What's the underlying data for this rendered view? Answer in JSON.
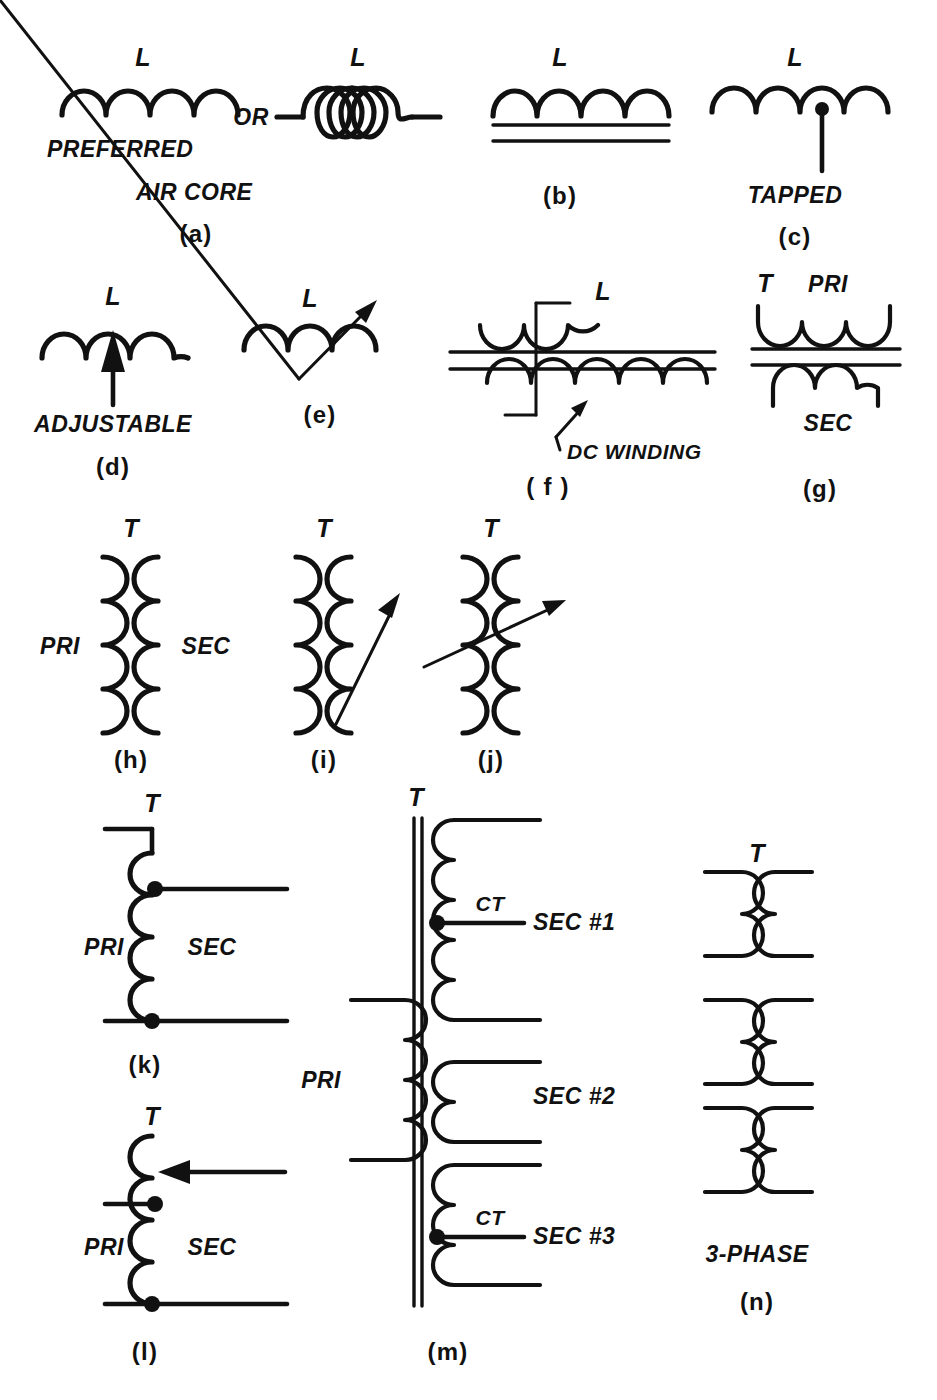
{
  "figure": {
    "background_color": "#ffffff",
    "ink_color": "#111111"
  },
  "panels": [
    {
      "id": "a",
      "caption": "(a)",
      "symbols": [
        "L",
        "L"
      ],
      "connector": "OR",
      "notes": [
        "PREFERRED",
        "AIR CORE"
      ],
      "description": "air-core inductor, arc style and spiral style"
    },
    {
      "id": "b",
      "caption": "(b)",
      "symbols": [
        "L"
      ],
      "notes": [],
      "description": "iron-core inductor with two core lines"
    },
    {
      "id": "c",
      "caption": "(c)",
      "symbols": [
        "L"
      ],
      "notes": [
        "TAPPED"
      ],
      "description": "tapped inductor"
    },
    {
      "id": "d",
      "caption": "(d)",
      "symbols": [
        "L"
      ],
      "notes": [
        "ADJUSTABLE"
      ],
      "description": "adjustable inductor, vertical arrow"
    },
    {
      "id": "e",
      "caption": "(e)",
      "symbols": [
        "L"
      ],
      "notes": [],
      "description": "variable inductor, diagonal arrow"
    },
    {
      "id": "f",
      "caption": "( f )",
      "symbols": [
        "L"
      ],
      "notes": [
        "DC WINDING"
      ],
      "description": "saturable reactor with DC control winding"
    },
    {
      "id": "g",
      "caption": "(g)",
      "symbols": [
        "T"
      ],
      "notes": [
        "PRI",
        "SEC"
      ],
      "description": "iron-core transformer, horizontal"
    },
    {
      "id": "h",
      "caption": "(h)",
      "symbols": [
        "T"
      ],
      "notes": [
        "PRI",
        "SEC"
      ],
      "description": "air-core transformer, vertical windings"
    },
    {
      "id": "i",
      "caption": "(i)",
      "symbols": [
        "T"
      ],
      "notes": [],
      "description": "variable coupling transformer, arrow on secondary"
    },
    {
      "id": "j",
      "caption": "(j)",
      "symbols": [
        "T"
      ],
      "notes": [],
      "description": "variable coupling transformer, arrow across both windings"
    },
    {
      "id": "k",
      "caption": "(k)",
      "symbols": [
        "T"
      ],
      "notes": [
        "PRI",
        "SEC"
      ],
      "description": "autotransformer with fixed taps"
    },
    {
      "id": "l",
      "caption": "(l)",
      "symbols": [
        "T"
      ],
      "notes": [
        "PRI",
        "SEC"
      ],
      "description": "variable autotransformer with sliding contact"
    },
    {
      "id": "m",
      "caption": "(m)",
      "symbols": [
        "T"
      ],
      "notes": [
        "PRI",
        "CT",
        "SEC #1",
        "SEC #2",
        "CT",
        "SEC #3"
      ],
      "description": "multi-secondary transformer with center taps"
    },
    {
      "id": "n",
      "caption": "(n)",
      "symbols": [
        "T"
      ],
      "notes": [
        "3-PHASE"
      ],
      "description": "three-phase transformer"
    }
  ],
  "labels": {
    "a_L_left": "L",
    "a_or": "OR",
    "a_L_right": "L",
    "a_preferred": "PREFERRED",
    "a_aircore": "AIR CORE",
    "a_caption": "(a)",
    "b_L": "L",
    "b_caption": "(b)",
    "c_L": "L",
    "c_tapped": "TAPPED",
    "c_caption": "(c)",
    "d_L": "L",
    "d_adjustable": "ADJUSTABLE",
    "d_caption": "(d)",
    "e_L": "L",
    "e_caption": "(e)",
    "f_L": "L",
    "f_dcwinding": "DC WINDING",
    "f_caption": "( f )",
    "g_T": "T",
    "g_pri": "PRI",
    "g_sec": "SEC",
    "g_caption": "(g)",
    "h_T": "T",
    "h_pri": "PRI",
    "h_sec": "SEC",
    "h_caption": "(h)",
    "i_T": "T",
    "i_caption": "(i)",
    "j_T": "T",
    "j_caption": "(j)",
    "k_T": "T",
    "k_pri": "PRI",
    "k_sec": "SEC",
    "k_caption": "(k)",
    "l_T": "T",
    "l_pri": "PRI",
    "l_sec": "SEC",
    "l_caption": "(l)",
    "m_T": "T",
    "m_pri": "PRI",
    "m_ct1": "CT",
    "m_sec1": "SEC #1",
    "m_sec2": "SEC #2",
    "m_ct3": "CT",
    "m_sec3": "SEC #3",
    "m_caption": "(m)",
    "n_T": "T",
    "n_3phase": "3-PHASE",
    "n_caption": "(n)"
  }
}
